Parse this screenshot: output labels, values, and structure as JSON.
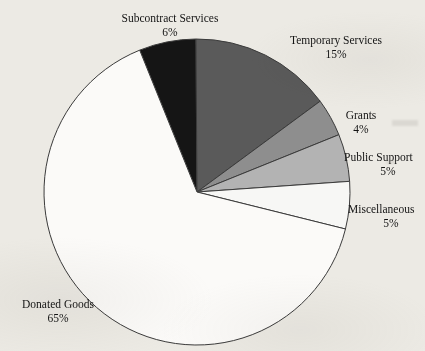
{
  "page": {
    "background_color": "#eceae4",
    "cropped_title": "REVENUE BY PROGRAM SERVICE"
  },
  "chart_data": {
    "type": "pie",
    "title": "",
    "xlabel": "",
    "ylabel": "",
    "legend_position": "callout-labels",
    "grid": false,
    "units": "percent",
    "total": 100,
    "start_angle_deg": -22,
    "direction": "clockwise",
    "center": {
      "x": 197,
      "y": 192
    },
    "radius": 153,
    "categories": [
      "Subcontract Services",
      "Temporary Services",
      "Grants",
      "Public Support",
      "Miscellaneous",
      "Donated Goods"
    ],
    "values": [
      6,
      15,
      4,
      5,
      5,
      65
    ],
    "value_labels": [
      "6%",
      "15%",
      "4%",
      "5%",
      "5%",
      "65%"
    ],
    "colors": [
      "#151515",
      "#5a5a5a",
      "#8e8e8e",
      "#b3b3b3",
      "#f7f7f5",
      "#fbfaf8"
    ],
    "slices": [
      {
        "id": "subcontract",
        "label": "Subcontract Services",
        "percent_label": "6%",
        "value": 6,
        "color": "#151515"
      },
      {
        "id": "temporary",
        "label": "Temporary Services",
        "percent_label": "15%",
        "value": 15,
        "color": "#5a5a5a"
      },
      {
        "id": "grants",
        "label": "Grants",
        "percent_label": "4%",
        "value": 4,
        "color": "#8e8e8e"
      },
      {
        "id": "public",
        "label": "Public Support",
        "percent_label": "5%",
        "value": 5,
        "color": "#b3b3b3"
      },
      {
        "id": "misc",
        "label": "Miscellaneous",
        "percent_label": "5%",
        "value": 5,
        "color": "#f7f7f5"
      },
      {
        "id": "donated",
        "label": "Donated Goods",
        "percent_label": "65%",
        "value": 65,
        "color": "#fbfaf8"
      }
    ]
  }
}
